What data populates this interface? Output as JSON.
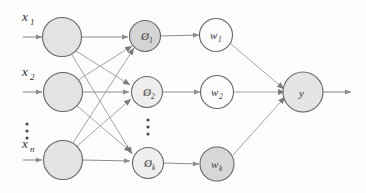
{
  "diagram": {
    "background_color": "#fdfdfd",
    "edge_color": "#8d8d8d",
    "stroke_color": "#5a5a5a",
    "input_fill": "#e2e2e2",
    "hidden_fill": "#d6d6d6",
    "weight_fill": "#fbfbfb",
    "weight_k_fill": "#d8d8d8",
    "output_fill": "#e4e4e4",
    "layers": {
      "input": {
        "name": "input-layer",
        "nodes": [
          {
            "id": "input-1",
            "label": "",
            "external_label": "x",
            "external_sub": "1"
          },
          {
            "id": "input-2",
            "label": "",
            "external_label": "x",
            "external_sub": "2"
          },
          {
            "id": "input-n",
            "label": "",
            "external_label": "x",
            "external_sub": "n"
          }
        ],
        "ellipsis": "⋮"
      },
      "hidden": {
        "name": "hidden-layer",
        "nodes": [
          {
            "id": "phi-1",
            "label": "Ø",
            "sub": "1"
          },
          {
            "id": "phi-2",
            "label": "Ø",
            "sub": "2"
          },
          {
            "id": "phi-k",
            "label": "Ø",
            "sub": "k"
          }
        ],
        "ellipsis": "⋮"
      },
      "weights": {
        "name": "weight-layer",
        "nodes": [
          {
            "id": "w-1",
            "label": "w",
            "sub": "1"
          },
          {
            "id": "w-2",
            "label": "w",
            "sub": "2"
          },
          {
            "id": "w-k",
            "label": "w",
            "sub": "k"
          }
        ]
      },
      "output": {
        "name": "output-layer",
        "nodes": [
          {
            "id": "y",
            "label": "y",
            "sub": ""
          }
        ]
      }
    },
    "labels": {
      "x1": "x",
      "x1_sub": "1",
      "x2": "x",
      "x2_sub": "2",
      "xn": "x",
      "xn_sub": "n",
      "phi1": "Ø",
      "phi1_sub": "1",
      "phi2": "Ø",
      "phi2_sub": "2",
      "phik": "Ø",
      "phik_sub": "k",
      "w1": "w",
      "w1_sub": "1",
      "w2": "w",
      "w2_sub": "2",
      "wk": "w",
      "wk_sub": "k",
      "y": "y"
    }
  }
}
